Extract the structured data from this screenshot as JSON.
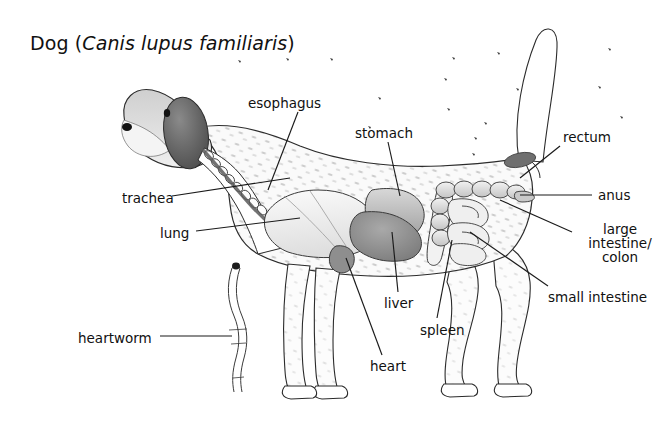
{
  "figure": {
    "title_common": "Dog (",
    "title_scientific": "Canis lupus familiaris",
    "title_close": ")",
    "background_color": "#ffffff",
    "ink_color": "#111111",
    "fur_tone": "#f2f2f2",
    "organ_tone": "#d9d9d9",
    "dark_tone": "#6f6f6f"
  },
  "labels": [
    {
      "id": "esophagus",
      "text": "esophagus",
      "x": 248,
      "y": 96,
      "align": "left"
    },
    {
      "id": "stomach",
      "text": "stomach",
      "x": 355,
      "y": 126,
      "align": "left"
    },
    {
      "id": "rectum",
      "text": "rectum",
      "x": 563,
      "y": 130,
      "align": "left"
    },
    {
      "id": "trachea",
      "text": "trachea",
      "x": 122,
      "y": 191,
      "align": "left"
    },
    {
      "id": "anus",
      "text": "anus",
      "x": 598,
      "y": 188,
      "align": "left"
    },
    {
      "id": "lung",
      "text": "lung",
      "x": 160,
      "y": 226,
      "align": "left"
    },
    {
      "id": "large-intestine",
      "text": "large\nintestine/\ncolon",
      "x": 580,
      "y": 222,
      "align": "center"
    },
    {
      "id": "small-intestine",
      "text": "small intestine",
      "x": 548,
      "y": 290,
      "align": "left"
    },
    {
      "id": "liver",
      "text": "liver",
      "x": 384,
      "y": 296,
      "align": "left"
    },
    {
      "id": "spleen",
      "text": "spleen",
      "x": 420,
      "y": 323,
      "align": "left"
    },
    {
      "id": "heartworm",
      "text": "heartworm",
      "x": 78,
      "y": 331,
      "align": "left"
    },
    {
      "id": "heart",
      "text": "heart",
      "x": 370,
      "y": 359,
      "align": "left"
    }
  ],
  "leader_lines": [
    {
      "id": "esophagus-leader",
      "points": "298,112 268,190"
    },
    {
      "id": "stomach-leader",
      "points": "388,142 400,196"
    },
    {
      "id": "rectum-leader",
      "points": "560,146 520,178"
    },
    {
      "id": "trachea-leader",
      "points": "172,196 290,178"
    },
    {
      "id": "anus-leader",
      "points": "592,195 520,195"
    },
    {
      "id": "lung-leader",
      "points": "196,231 300,218"
    },
    {
      "id": "large-intestine-leader",
      "points": "572,232 500,200"
    },
    {
      "id": "small-intestine-leader",
      "points": "548,286 470,232"
    },
    {
      "id": "liver-leader",
      "points": "398,292 392,232"
    },
    {
      "id": "spleen-leader",
      "points": "437,318 452,240"
    },
    {
      "id": "heartworm-leader",
      "points": "160,336 232,336"
    },
    {
      "id": "heart-leader",
      "points": "382,355 346,258"
    }
  ],
  "anatomy_parts": [
    {
      "id": "head",
      "name": "dog-head"
    },
    {
      "id": "ear",
      "name": "dog-ear"
    },
    {
      "id": "nose",
      "name": "dog-nose"
    },
    {
      "id": "eye",
      "name": "dog-eye"
    },
    {
      "id": "body",
      "name": "dog-body-outline"
    },
    {
      "id": "tail",
      "name": "dog-tail"
    },
    {
      "id": "front-legs",
      "name": "dog-front-legs"
    },
    {
      "id": "hind-legs",
      "name": "dog-hind-legs"
    },
    {
      "id": "trachea",
      "name": "trachea-organ"
    },
    {
      "id": "esophagus",
      "name": "esophagus-organ"
    },
    {
      "id": "lung",
      "name": "lung-organ"
    },
    {
      "id": "heart",
      "name": "heart-organ"
    },
    {
      "id": "liver",
      "name": "liver-organ"
    },
    {
      "id": "stomach",
      "name": "stomach-organ"
    },
    {
      "id": "spleen",
      "name": "spleen-organ"
    },
    {
      "id": "large-intestine",
      "name": "large-intestine-organ"
    },
    {
      "id": "small-intestine",
      "name": "small-intestine-organ"
    },
    {
      "id": "rectum",
      "name": "rectum-organ"
    },
    {
      "id": "heartworm",
      "name": "heartworm-illustration"
    }
  ]
}
